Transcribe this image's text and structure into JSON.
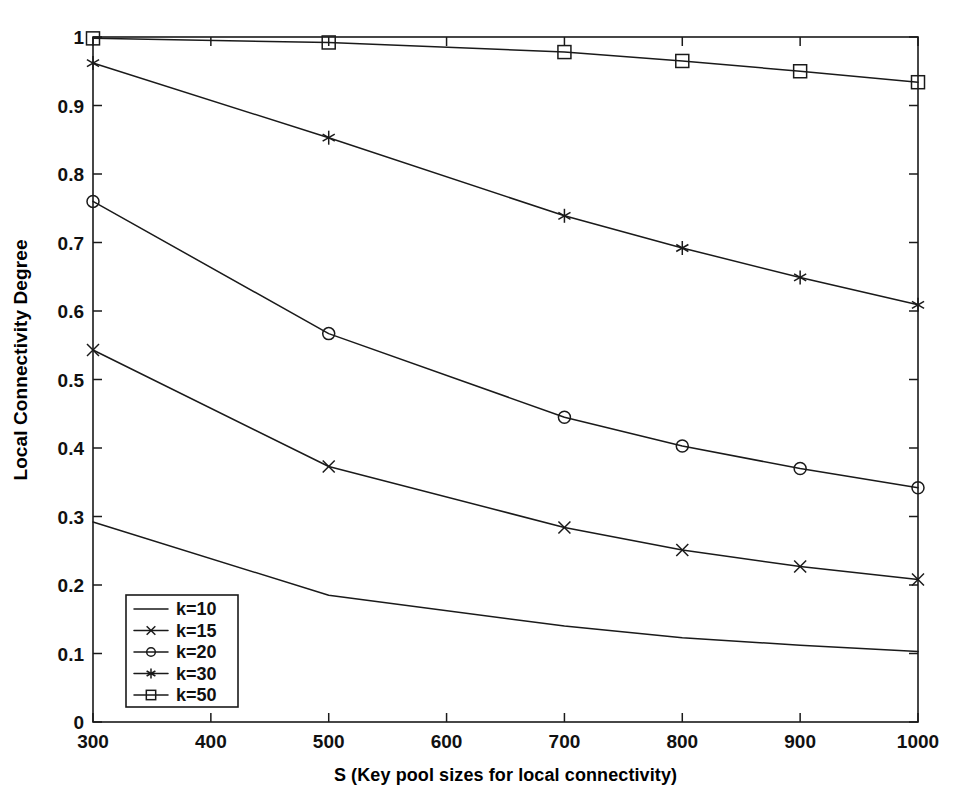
{
  "chart_data": {
    "type": "line",
    "title": "",
    "xlabel": "S (Key pool sizes for local connectivity)",
    "ylabel": "Local Connectivity Degree",
    "x": [
      300,
      500,
      700,
      800,
      900,
      1000
    ],
    "xlim": [
      300,
      1000
    ],
    "ylim": [
      0,
      1
    ],
    "xticks": [
      300,
      400,
      500,
      600,
      700,
      800,
      900,
      1000
    ],
    "xtick_labels": [
      "300",
      "400",
      "500",
      "600",
      "700",
      "800",
      "900",
      "1000"
    ],
    "yticks": [
      0,
      0.1,
      0.2,
      0.3,
      0.4,
      0.5,
      0.6,
      0.7,
      0.8,
      0.9,
      1
    ],
    "ytick_labels": [
      "0",
      "0.1",
      "0.2",
      "0.3",
      "0.4",
      "0.5",
      "0.6",
      "0.7",
      "0.8",
      "0.9",
      "1"
    ],
    "grid": false,
    "legend_position": "lower left",
    "line_color": "#1a1a1a",
    "background": "#ffffff",
    "series": [
      {
        "name": "k=10",
        "marker": "none",
        "values": [
          0.292,
          0.185,
          0.14,
          0.123,
          0.112,
          0.103
        ]
      },
      {
        "name": "k=15",
        "marker": "x",
        "values": [
          0.543,
          0.373,
          0.284,
          0.251,
          0.227,
          0.208
        ]
      },
      {
        "name": "k=20",
        "marker": "circle",
        "values": [
          0.76,
          0.567,
          0.445,
          0.403,
          0.37,
          0.342
        ]
      },
      {
        "name": "k=30",
        "marker": "asterisk",
        "values": [
          0.962,
          0.853,
          0.739,
          0.692,
          0.649,
          0.609
        ]
      },
      {
        "name": "k=50",
        "marker": "square",
        "values": [
          0.998,
          0.992,
          0.978,
          0.965,
          0.95,
          0.934
        ]
      }
    ],
    "legend_entries": [
      {
        "label": "k=10",
        "marker": "none"
      },
      {
        "label": "k=15",
        "marker": "x"
      },
      {
        "label": "k=20",
        "marker": "circle"
      },
      {
        "label": "k=30",
        "marker": "asterisk"
      },
      {
        "label": "k=50",
        "marker": "square"
      }
    ]
  }
}
